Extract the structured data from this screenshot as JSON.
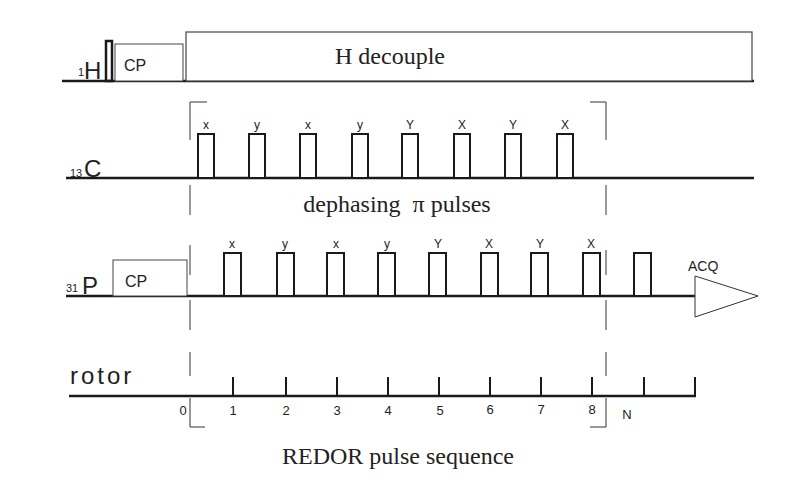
{
  "title": "REDOR pulse sequence",
  "channels": {
    "h1": {
      "label": "H",
      "superscript": "1",
      "cp_label": "CP",
      "decouple_label": "H decouple"
    },
    "c13": {
      "label": "C",
      "superscript": "13",
      "annotation": "dephasing  π pulses",
      "pulse_phases": [
        "x",
        "y",
        "x",
        "y",
        "Y",
        "X",
        "Y",
        "X"
      ]
    },
    "p31": {
      "label": "P",
      "superscript": "31",
      "cp_label": "CP",
      "acq_label": "ACQ",
      "pulse_phases": [
        "x",
        "y",
        "x",
        "y",
        "Y",
        "X",
        "Y",
        "X"
      ]
    },
    "rotor": {
      "label": "rotor",
      "ticks": [
        "0",
        "1",
        "2",
        "3",
        "4",
        "5",
        "6",
        "7",
        "8",
        "N"
      ]
    }
  },
  "colors": {
    "line": "#1a1a1a",
    "box": "#333333",
    "background": "#ffffff"
  }
}
